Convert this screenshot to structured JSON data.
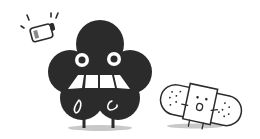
{
  "illustration": {
    "description": "Black cloud-shaped character with worried face next to a low battery and a scared bandage character",
    "colors": {
      "background": "#ffffff",
      "ink": "#2b2b2b",
      "shadow": "#c8c8c8",
      "battery_level": "#888888"
    },
    "elements": [
      "low-battery-icon",
      "cloud-character",
      "bandage-character"
    ]
  }
}
